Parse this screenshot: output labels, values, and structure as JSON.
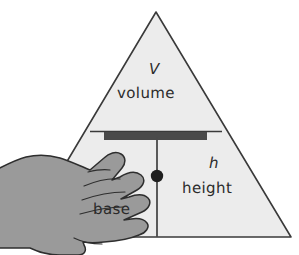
{
  "diagram": {
    "kind": "formula-triangle",
    "colors": {
      "background": "#ffffff",
      "triangle_fill": "#ececec",
      "triangle_stroke": "#3a3a3a",
      "divider_stroke": "#3a3a3a",
      "bar_fill": "#4a4a4a",
      "hand_fill": "#9a9a9a",
      "hand_stroke": "#2e2e2e",
      "dot_fill": "#1f1f1f",
      "text": "#2b2b2b"
    },
    "labels": {
      "top_symbol": "V",
      "top_word": "volume",
      "right_symbol": "h",
      "right_word": "height",
      "left_word": "base"
    },
    "occlusion": {
      "element": "hand",
      "covers": "base",
      "visible_fragment": "se"
    }
  }
}
